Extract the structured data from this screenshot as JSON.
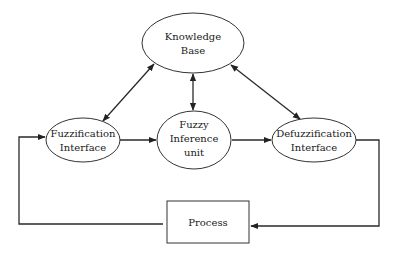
{
  "diagram": {
    "type": "fuzzy-logic-controller-block-diagram",
    "nodes": {
      "knowledge_base": {
        "line1": "Knowledge",
        "line2": "Base",
        "shape": "ellipse"
      },
      "fuzzification": {
        "line1": "Fuzzification",
        "line2": "Interface",
        "shape": "ellipse"
      },
      "inference": {
        "line1": "Fuzzy",
        "line2": "Inference",
        "line3": "unit",
        "shape": "ellipse"
      },
      "defuzzification": {
        "line1": "Defuzzification",
        "line2": "Interface",
        "shape": "ellipse"
      },
      "process": {
        "label": "Process",
        "shape": "rectangle"
      }
    },
    "edges": [
      {
        "from": "knowledge_base",
        "to": "fuzzification",
        "direction": "bidirectional"
      },
      {
        "from": "knowledge_base",
        "to": "inference",
        "direction": "bidirectional"
      },
      {
        "from": "knowledge_base",
        "to": "defuzzification",
        "direction": "bidirectional"
      },
      {
        "from": "fuzzification",
        "to": "inference",
        "direction": "forward"
      },
      {
        "from": "inference",
        "to": "defuzzification",
        "direction": "forward"
      },
      {
        "from": "defuzzification",
        "to": "process",
        "direction": "forward"
      },
      {
        "from": "process",
        "to": "fuzzification",
        "direction": "forward"
      }
    ],
    "colors": {
      "stroke": "#333333",
      "background": "#ffffff",
      "text": "#1a1a1a"
    }
  }
}
